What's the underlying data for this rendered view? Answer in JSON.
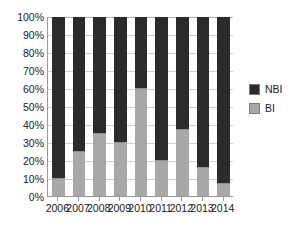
{
  "chart_data": {
    "type": "bar",
    "stacked": true,
    "normalized_percent": true,
    "title": "",
    "subtitle": "",
    "xlabel": "",
    "ylabel": "",
    "categories": [
      "2006",
      "2007",
      "2008",
      "2009",
      "2010",
      "2011",
      "2012",
      "2013",
      "2014"
    ],
    "series": [
      {
        "name": "BI",
        "values": [
          10,
          25,
          35,
          30,
          60,
          20,
          37,
          16,
          7
        ]
      },
      {
        "name": "NBI",
        "values": [
          90,
          75,
          65,
          70,
          40,
          80,
          63,
          84,
          93
        ]
      }
    ],
    "ylim": [
      0,
      100
    ],
    "ytick_values": [
      0,
      10,
      20,
      30,
      40,
      50,
      60,
      70,
      80,
      90,
      100
    ],
    "ytick_labels": [
      "0%",
      "10%",
      "20%",
      "30%",
      "40%",
      "50%",
      "60%",
      "70%",
      "80%",
      "90%",
      "100%"
    ],
    "grid": "horizontal",
    "legend_position": "right",
    "legend_entries": [
      {
        "label": "NBI",
        "color": "#2b2b2b"
      },
      {
        "label": "BI",
        "color": "#a8a8a8"
      }
    ],
    "colors": {
      "bi": "#a8a8a8",
      "nbi": "#2b2b2b",
      "grid": "#cfcfcf",
      "axis": "#9a9a9a",
      "text": "#1a1a1a",
      "background": "#ffffff"
    }
  }
}
